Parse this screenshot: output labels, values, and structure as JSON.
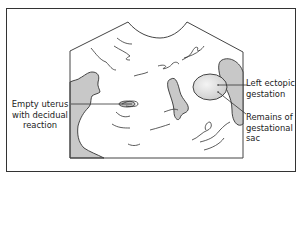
{
  "diagram": {
    "type": "ultrasound schematic",
    "labels": {
      "empty_uterus": [
        "Empty uterus",
        "with decidual",
        "reaction"
      ],
      "left_ectopic": [
        "Left ectopic",
        "gestation"
      ],
      "remains_sac": [
        "Remains of",
        "gestational",
        "sac"
      ]
    },
    "colors": {
      "line": "#333333",
      "fill_gray": "#c8c8c8",
      "fill_light": "#e6e6e6",
      "background": "#ffffff"
    }
  }
}
